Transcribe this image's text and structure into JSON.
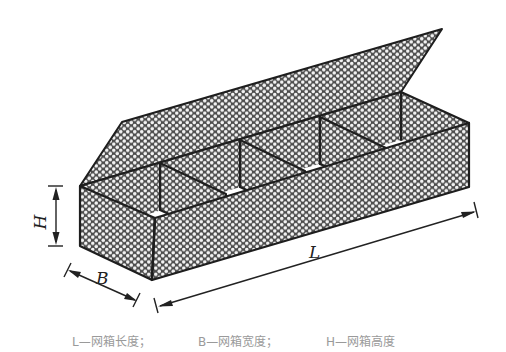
{
  "figure": {
    "compartments": 4,
    "dividers": 3,
    "colors": {
      "line": "#1e1e1e",
      "mesh_fill": "#5a5a5a",
      "mesh_hole": "#f4f4f4",
      "background": "#ffffff"
    }
  },
  "dimensions": {
    "height_label": "H",
    "width_label": "B",
    "length_label": "L"
  },
  "caption": {
    "items": [
      "L—网箱长度；",
      "B—网箱宽度；",
      "H—网箱高度"
    ]
  }
}
